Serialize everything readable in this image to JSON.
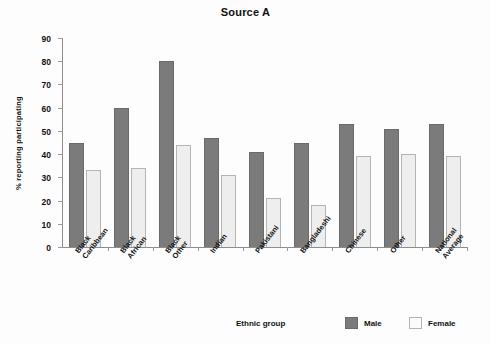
{
  "chart_data": {
    "type": "bar",
    "title": "Source A",
    "xlabel": "Ethnic group",
    "ylabel": "% reporting participating",
    "ylim": [
      0,
      90
    ],
    "ytick_step": 10,
    "yticks": [
      0,
      10,
      20,
      30,
      40,
      50,
      60,
      70,
      80,
      90
    ],
    "grid": false,
    "legend_position": "bottom-right",
    "categories": [
      "Black Caribbean",
      "Black African",
      "Black Other",
      "Indian",
      "Pakistani",
      "Bangladeshi",
      "Chinese",
      "Other",
      "National Average"
    ],
    "series": [
      {
        "name": "Male",
        "color": "#7b7b7b",
        "values": [
          45,
          60,
          80,
          47,
          41,
          45,
          53,
          51,
          53
        ]
      },
      {
        "name": "Female",
        "color": "#eeeeee",
        "values": [
          33,
          34,
          44,
          31,
          21,
          18,
          39,
          40,
          39
        ]
      }
    ]
  },
  "legend": {
    "male_label": "Male",
    "female_label": "Female"
  }
}
